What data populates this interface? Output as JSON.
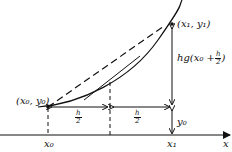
{
  "diagram": {
    "labels": {
      "p0": "(x₀, y₀)",
      "p1": "(x₁, y₁)",
      "x0": "x₀",
      "x1": "x₁",
      "xaxis": "x",
      "y0": "y₀",
      "height_prefix": "hg(x₀ + ",
      "height_suffix": " )",
      "half_num": "h",
      "half_den": "2"
    },
    "colors": {
      "ink": "#111111",
      "background": "#ffffff"
    }
  }
}
